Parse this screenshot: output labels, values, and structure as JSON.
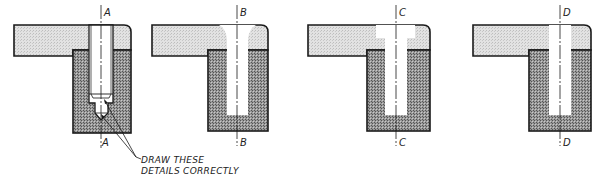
{
  "figures": [
    {
      "id": "A",
      "label_top": "A",
      "label_bottom": "A",
      "hole_type": "drilled-tapped-blind"
    },
    {
      "id": "B",
      "label_top": "B",
      "label_bottom": "B",
      "hole_type": "countersunk-curved"
    },
    {
      "id": "C",
      "label_top": "C",
      "label_bottom": "C",
      "hole_type": "counterbored"
    },
    {
      "id": "D",
      "label_top": "D",
      "label_bottom": "D",
      "hole_type": "straight"
    }
  ],
  "note": {
    "line1": "DRAW THESE",
    "line2": "DETAILS CORRECTLY"
  },
  "colors": {
    "plate_fill": "#d8d8d8",
    "block_fill": "#8a8a8a",
    "outline": "#1a1a1a",
    "hole": "#ffffff"
  }
}
